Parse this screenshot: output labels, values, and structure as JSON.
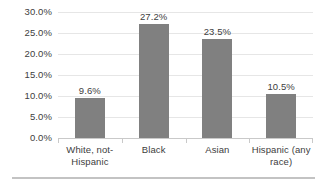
{
  "chart_data": {
    "type": "bar",
    "title": "",
    "subtitle": "",
    "xlabel": "",
    "ylabel": "",
    "categories": [
      "White, not-Hispanic",
      "Black",
      "Asian",
      "Hispanic (any race)"
    ],
    "values": [
      9.6,
      27.2,
      23.5,
      10.5
    ],
    "value_labels": [
      "9.6%",
      "27.2%",
      "23.5%",
      "10.5%"
    ],
    "ylim": [
      0,
      30
    ],
    "ytick_values": [
      0,
      5,
      10,
      15,
      20,
      25,
      30
    ],
    "ytick_labels": [
      "0.0%",
      "5.0%",
      "10.0%",
      "15.0%",
      "20.0%",
      "25.0%",
      "30.0%"
    ],
    "grid": true,
    "legend": false,
    "legend_position": "none",
    "bar_color": "#808080",
    "gridline_color": "#e6e6e6",
    "axis_color": "#c9c9c9",
    "text_color": "#404040",
    "background_color": "#ffffff"
  }
}
